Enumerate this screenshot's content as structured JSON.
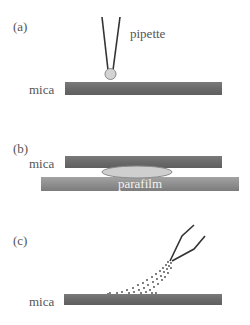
{
  "panels": [
    {
      "id": "a",
      "label": "(a)",
      "labels": {
        "pipette": "pipette",
        "mica": "mica"
      },
      "colors": {
        "mica": "#6a6a6a",
        "droplet_fill": "#d3d3d3",
        "droplet_stroke": "#8a8a8a",
        "pipette": "#333333"
      }
    },
    {
      "id": "b",
      "label": "(b)",
      "labels": {
        "mica": "mica",
        "parafilm": "parafilm"
      },
      "colors": {
        "mica": "#6a6a6a",
        "parafilm": "#8f8f8f",
        "droplet_fill": "#cfcfcf",
        "droplet_stroke": "#8a8a8a"
      }
    },
    {
      "id": "c",
      "label": "(c)",
      "labels": {
        "mica": "mica"
      },
      "colors": {
        "mica": "#6a6a6a",
        "pipette": "#333333",
        "spray": "#444444"
      }
    }
  ]
}
